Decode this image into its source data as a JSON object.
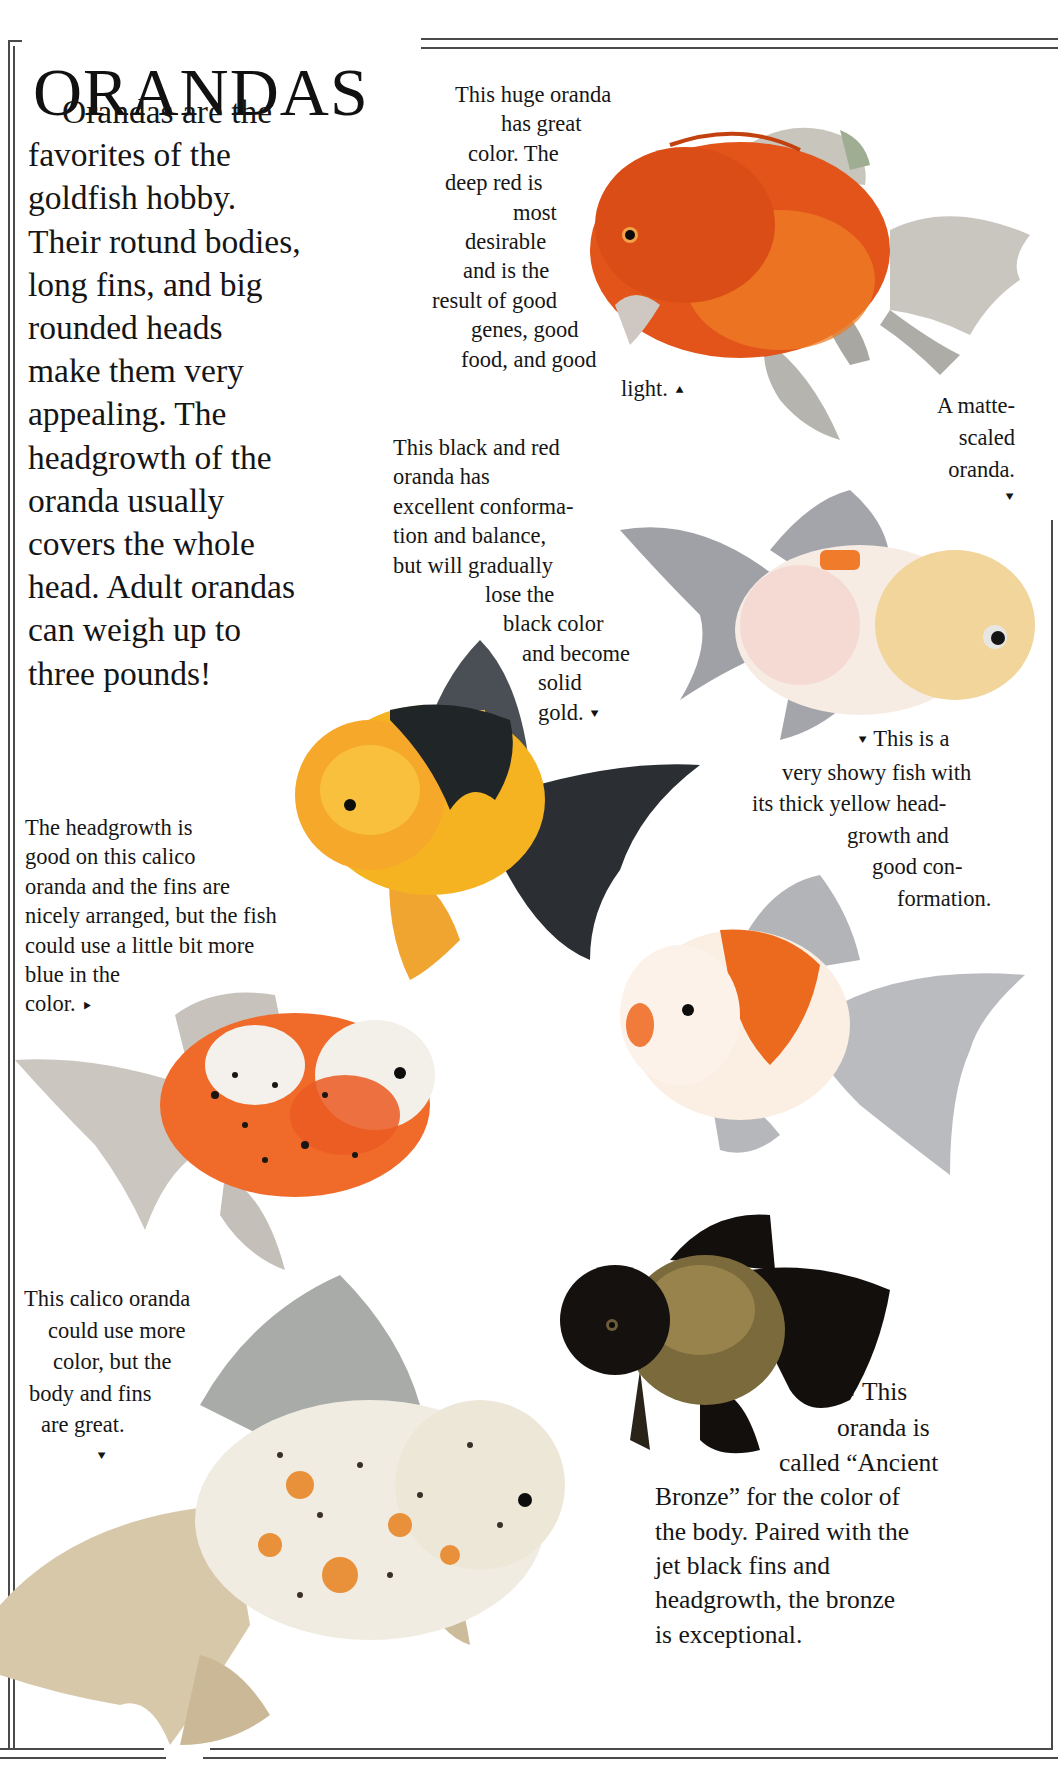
{
  "page": {
    "title": "ORANDAS",
    "intro_lines": [
      "Orandas are the",
      "favorites of the",
      "goldfish hobby.",
      "Their rotund bodies,",
      "long fins, and big",
      "rounded heads",
      "make them very",
      "appealing. The",
      "headgrowth of the",
      "oranda usually",
      "covers the whole",
      "head. Adult orandas",
      "can weigh up to",
      "three pounds!"
    ]
  },
  "captions": [
    {
      "id": "huge-red-oranda",
      "lines": [
        "This huge oranda",
        "has great",
        "color. The",
        "deep red is",
        "most",
        "desirable",
        "and is the",
        "result of good",
        "genes, good",
        "food, and good",
        "light."
      ],
      "arrow": "up",
      "arrow_glyph": "⯅"
    },
    {
      "id": "matte-scaled",
      "lines": [
        "A matte-",
        "scaled",
        "oranda."
      ],
      "arrow": "down",
      "arrow_glyph": "⯆"
    },
    {
      "id": "black-and-red",
      "lines": [
        "This black and red",
        "oranda has",
        "excellent conforma-",
        "tion and balance,",
        "but will gradually",
        "lose the",
        "black color",
        "and become",
        "solid",
        "gold."
      ],
      "arrow": "down",
      "arrow_glyph": "⯆"
    },
    {
      "id": "showy-yellow",
      "lines": [
        "This is a",
        "very showy fish with",
        "its thick yellow head-",
        "growth and",
        "good con-",
        "formation."
      ],
      "arrow": "down",
      "arrow_glyph": "⯆"
    },
    {
      "id": "calico-headgrowth",
      "lines": [
        "The headgrowth is",
        "good on this calico",
        "oranda and the fins are",
        "nicely arranged, but the fish",
        "could use a little bit more",
        "blue in the",
        "color."
      ],
      "arrow": "right",
      "arrow_glyph": "⯈"
    },
    {
      "id": "calico-more-color",
      "lines": [
        "This calico oranda",
        "could use more",
        "color, but the",
        "body and fins",
        "are great."
      ],
      "arrow": "down",
      "arrow_glyph": "⯆"
    },
    {
      "id": "ancient-bronze",
      "lines": [
        "This",
        "oranda is",
        "called “Ancient",
        "Bronze” for the color of",
        "the body. Paired with the",
        "jet black fins and",
        "headgrowth, the bronze",
        "is exceptional."
      ],
      "arrow": "left",
      "arrow_glyph": "⯇"
    }
  ],
  "photos": [
    {
      "id": "fish-red-oranda",
      "label": "red oranda photo",
      "colors": {
        "body": "#e2541a",
        "fin": "#b9b8b2"
      }
    },
    {
      "id": "fish-matte-scaled",
      "label": "matte-scaled oranda photo",
      "colors": {
        "body": "#f7ece4",
        "head": "#f1d59a",
        "fin": "#9ea0a4"
      }
    },
    {
      "id": "fish-black-red",
      "label": "black and red oranda photo",
      "colors": {
        "body": "#f5b51e",
        "patch": "#1f2326",
        "fin": "#3a3f44"
      }
    },
    {
      "id": "fish-showy-yellow",
      "label": "red and white oranda photo",
      "colors": {
        "body": "#fbeee2",
        "patch": "#ec6a1e",
        "fin": "#b7b9bd"
      }
    },
    {
      "id": "fish-calico",
      "label": "calico oranda photo",
      "colors": {
        "body": "#f06a2a",
        "fin": "#c9c4bf"
      }
    },
    {
      "id": "fish-ancient-bronze",
      "label": "ancient bronze oranda photo",
      "colors": {
        "body": "#7a6a3c",
        "fin": "#120e0c"
      }
    },
    {
      "id": "fish-calico-large",
      "label": "large calico oranda photo",
      "colors": {
        "body": "#f1ece2",
        "spots": "#e89a3a",
        "fin": "#d8c3a0"
      }
    }
  ]
}
